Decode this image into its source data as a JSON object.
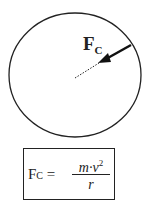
{
  "diagram": {
    "force_label": "F",
    "force_subscript": "C",
    "colors": {
      "stroke": "#222222",
      "background": "#ffffff"
    }
  },
  "formula": {
    "lhs": "F",
    "lhs_subscript": "C",
    "equals": "=",
    "numerator": "m·v",
    "numerator_exponent": "2",
    "denominator": "r"
  }
}
